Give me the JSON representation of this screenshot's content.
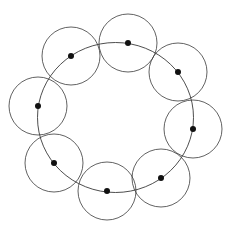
{
  "diagram": {
    "type": "ring-of-circles",
    "colors": {
      "stroke": "#3a3a3a",
      "dot": "#111111",
      "background": "#ffffff"
    },
    "ring": {
      "cx": 115.5,
      "cy": 117.5,
      "rx": 78,
      "ry": 75
    },
    "circle_radius": 29,
    "dot_radius": 3,
    "nodes": [
      {
        "id": 1,
        "x": 128,
        "y": 43
      },
      {
        "id": 2,
        "x": 178,
        "y": 72
      },
      {
        "id": 3,
        "x": 193,
        "y": 129
      },
      {
        "id": 4,
        "x": 161,
        "y": 178
      },
      {
        "id": 5,
        "x": 107,
        "y": 191
      },
      {
        "id": 6,
        "x": 54,
        "y": 163
      },
      {
        "id": 7,
        "x": 38,
        "y": 106
      },
      {
        "id": 8,
        "x": 71,
        "y": 56
      }
    ]
  }
}
